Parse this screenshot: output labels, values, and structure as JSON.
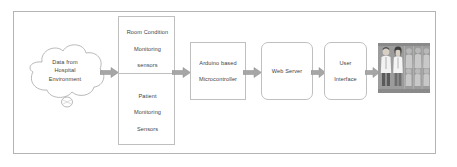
{
  "diagram": {
    "border_color": "#b4b4b4",
    "box_border_color": "#bfbfbf",
    "text_color": "#3f3f3f",
    "arrow_color": "#a6a6a6",
    "nodes": {
      "cloud": {
        "name": "data-source-cloud",
        "line1": "Data from",
        "line2": "Hospital",
        "line3": "Environment"
      },
      "room_sensors": {
        "name": "room-condition-monitoring-sensors",
        "line1": "Room Condition",
        "line2": "Monitoring",
        "line3": "sensors"
      },
      "patient_sensors": {
        "name": "patient-monitoring-sensors",
        "line1": "Patient",
        "line2": "Monitoring",
        "line3": "Sensors"
      },
      "microcontroller": {
        "name": "arduino-based-microcontroller",
        "line1": "Arduino based",
        "line2": "Microcontroller"
      },
      "web_server": {
        "name": "web-server",
        "label": "Web Server"
      },
      "user_interface": {
        "name": "user-interface",
        "line1": "User",
        "line2": "Interface"
      },
      "staff_photo": {
        "name": "medical-staff-photo",
        "alt": "photograph of hospital medical staff in white coats"
      }
    },
    "arrows": [
      {
        "name": "arrow-cloud-to-sensors"
      },
      {
        "name": "arrow-sensors-to-microcontroller"
      },
      {
        "name": "arrow-microcontroller-to-webserver"
      },
      {
        "name": "arrow-webserver-to-userinterface"
      },
      {
        "name": "arrow-userinterface-to-staff"
      }
    ]
  }
}
